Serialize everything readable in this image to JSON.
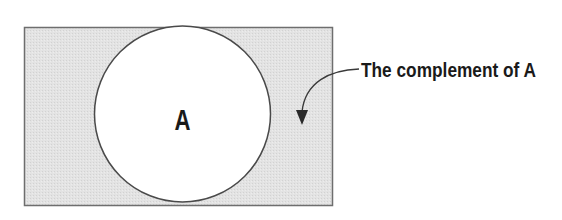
{
  "diagram": {
    "type": "venn",
    "universal_set": {
      "x": 24,
      "y": 27,
      "width": 308,
      "height": 178,
      "fill": "#e3e3e3",
      "stroke": "#6e6e6e"
    },
    "set_a": {
      "label": "A",
      "cx": 182,
      "cy": 114,
      "r": 88,
      "fill": "#ffffff",
      "stroke": "#4a4a4a"
    },
    "annotation": {
      "text": "The complement of A",
      "text_color": "#111111",
      "arrow_color": "#3a3a3a"
    }
  }
}
